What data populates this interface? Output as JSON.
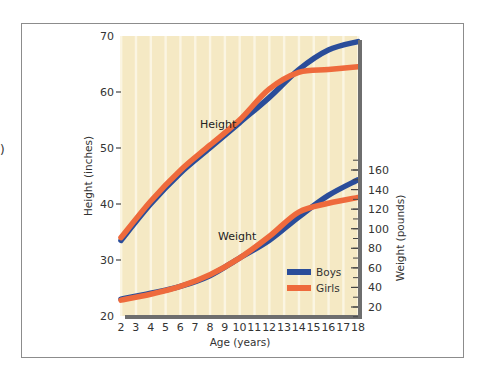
{
  "stray_text": ")",
  "chart_data": {
    "type": "line",
    "title": "",
    "xlabel": "Age (years)",
    "ylabel": "Height (inches)",
    "ylabel_right": "Weight (pounds)",
    "x": [
      2,
      4,
      6,
      8,
      10,
      12,
      14,
      16,
      18
    ],
    "x_ticks": [
      "2",
      "3",
      "4",
      "5",
      "6",
      "7",
      "8",
      "9",
      "10",
      "11",
      "12",
      "13",
      "14",
      "15",
      "16",
      "17",
      "18"
    ],
    "y_ticks_left": [
      "70",
      "60",
      "50",
      "40",
      "30",
      "20"
    ],
    "y_ticks_right": [
      "160",
      "140",
      "120",
      "100",
      "80",
      "60",
      "40",
      "20"
    ],
    "xlim": [
      2,
      18
    ],
    "ylim": [
      20,
      70
    ],
    "ylim_right": [
      10,
      170
    ],
    "grid": "vertical stripes per year",
    "legend": {
      "position": "lower right inside plot",
      "entries": [
        "Boys",
        "Girls"
      ]
    },
    "annotations": [
      "Height",
      "Weight"
    ],
    "colors": {
      "boys": "#2a4d9a",
      "girls": "#ee6a3c",
      "background": "#f5e9c4",
      "stripe": "#fbf5e2",
      "axis": "#6e6e6e"
    },
    "series": [
      {
        "name": "Boys",
        "group": "Height",
        "axis": "left",
        "values": [
          33.5,
          40,
          45.5,
          50,
          54.5,
          59,
          64,
          67.5,
          69
        ]
      },
      {
        "name": "Girls",
        "group": "Height",
        "axis": "left",
        "values": [
          34,
          40.5,
          46,
          50.5,
          55,
          60.5,
          63.5,
          64,
          64.5
        ]
      },
      {
        "name": "Boys",
        "group": "Weight",
        "axis": "right",
        "values": [
          28,
          34,
          41,
          52,
          70,
          88,
          112,
          134,
          150
        ]
      },
      {
        "name": "Girls",
        "group": "Weight",
        "axis": "right",
        "values": [
          27,
          33,
          41,
          53,
          70,
          92,
          117,
          126,
          132
        ]
      }
    ]
  }
}
